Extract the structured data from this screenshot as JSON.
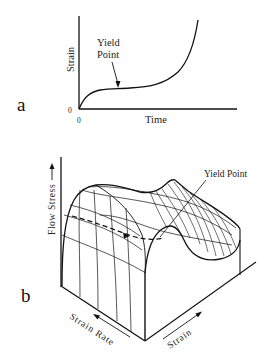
{
  "figure": {
    "panel_a": {
      "label": "a",
      "y_axis_label": "Strain",
      "x_axis_label": "Time",
      "y_origin_tick": "0",
      "x_origin_tick": "0",
      "annotation_line1": "Yield",
      "annotation_line2": "Point"
    },
    "panel_b": {
      "label": "b",
      "vertical_axis_label": "Flow Stress",
      "depth_axis_label": "Strain Rate",
      "horizontal_axis_label": "Strain",
      "annotation": "Yield Point"
    }
  },
  "colors": {
    "ink": "#111111",
    "background": "#ffffff"
  }
}
